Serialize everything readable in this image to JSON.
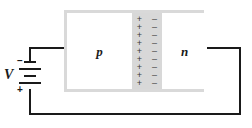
{
  "diagram": {
    "type": "circuit-schematic"
  },
  "device": {
    "p_region_label": "p",
    "n_region_label": "n",
    "depletion": {
      "rows": 9,
      "positive_sign": "+",
      "negative_sign": "–",
      "fill_color": "#d8d8d8"
    },
    "border_color": "#d9d9d9"
  },
  "source": {
    "label": "V",
    "negative_terminal": "–",
    "positive_terminal": "+",
    "cells": 2
  },
  "wire": {
    "color": "#1a1a1a"
  }
}
